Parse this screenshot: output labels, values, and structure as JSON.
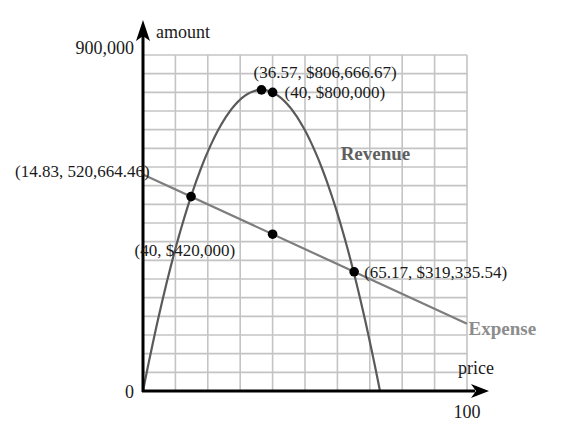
{
  "chart_data": {
    "type": "line",
    "title": "",
    "xlabel": "price",
    "ylabel": "amount",
    "xlim": [
      0,
      100
    ],
    "ylim": [
      0,
      900000
    ],
    "x_ticks": [
      {
        "value": 0,
        "label": "0"
      },
      {
        "value": 100,
        "label": "100"
      }
    ],
    "y_ticks": [
      {
        "value": 900000,
        "label": "900,000"
      }
    ],
    "grid": {
      "on": true,
      "x_step": 10,
      "y_step": 50000
    },
    "legend": "inline labels",
    "series": [
      {
        "name": "Revenue",
        "kind": "quadratic",
        "color": "#5a5a5a",
        "label_color": "#5f5f5f",
        "label_pos": {
          "x": 61,
          "y": 620000
        },
        "x_range": [
          0,
          73.14
        ],
        "vertex": {
          "x": 36.57,
          "y": 806666.67
        },
        "zeros": [
          0,
          73.14
        ]
      },
      {
        "name": "Expense",
        "kind": "linear",
        "color": "#7d7d7d",
        "label_color": "#8c8c8c",
        "label_pos": {
          "x": 100.5,
          "y": 150000
        },
        "x_range": [
          0,
          100
        ],
        "intercept": 580000,
        "slope": -4000
      }
    ],
    "points": [
      {
        "x": 36.57,
        "y": 806666.67,
        "label": "(36.57, $806,666.67)",
        "label_dx": -8,
        "label_dy": -12,
        "anchor": "start"
      },
      {
        "x": 40,
        "y": 800000,
        "label": "(40, $800,000)",
        "label_dx": 12,
        "label_dy": 6,
        "anchor": "start"
      },
      {
        "x": 14.83,
        "y": 520664.46,
        "label": "(14.83, 520,664.46)",
        "label_dx": -176,
        "label_dy": -20,
        "anchor": "start"
      },
      {
        "x": 40,
        "y": 420000,
        "label": "(40, $420,000)",
        "label_dx": -138,
        "label_dy": 22,
        "anchor": "start"
      },
      {
        "x": 65.17,
        "y": 319335.54,
        "label": "(65.17, $319,335.54)",
        "label_dx": 10,
        "label_dy": 6,
        "anchor": "start"
      }
    ]
  },
  "layout": {
    "origin_px": [
      143,
      391
    ],
    "x_end_px": 467,
    "y_top_px": 55
  }
}
